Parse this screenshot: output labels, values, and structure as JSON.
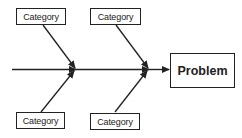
{
  "diagram": {
    "type": "fishbone",
    "problem": {
      "label": "Problem"
    },
    "categories": [
      {
        "label": "Category",
        "position": "top-left"
      },
      {
        "label": "Category",
        "position": "top-right"
      },
      {
        "label": "Category",
        "position": "bottom-left"
      },
      {
        "label": "Category",
        "position": "bottom-right"
      }
    ],
    "colors": {
      "stroke": "#222222",
      "background": "#ffffff",
      "text": "#222222"
    }
  }
}
